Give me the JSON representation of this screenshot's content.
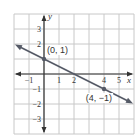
{
  "chart_data": {
    "type": "line",
    "title": "",
    "xlabel": "x",
    "ylabel": "y",
    "xlim": [
      -2,
      6
    ],
    "ylim": [
      -4,
      4
    ],
    "grid": true,
    "x_ticks": [
      {
        "value": -1,
        "label": "−1"
      },
      {
        "value": 1,
        "label": "1"
      },
      {
        "value": 2,
        "label": "2"
      },
      {
        "value": 4,
        "label": "4"
      },
      {
        "value": 5,
        "label": "5"
      }
    ],
    "y_ticks": [
      {
        "value": 3,
        "label": "3"
      },
      {
        "value": 2,
        "label": "2"
      },
      {
        "value": -1,
        "label": "−1"
      },
      {
        "value": -2,
        "label": "−2"
      },
      {
        "value": -3,
        "label": "−3"
      }
    ],
    "series": [
      {
        "name": "line",
        "equation": "y = -0.5x + 1",
        "x": [
          -2,
          6
        ],
        "y": [
          2,
          -2
        ]
      }
    ],
    "points": [
      {
        "x": 0,
        "y": 1,
        "label": "(0, 1)"
      },
      {
        "x": 4,
        "y": -1,
        "label": "(4, −1)"
      }
    ],
    "colors": {
      "grid": "#c8c8c8",
      "axis": "#333333",
      "line": "#555a66"
    }
  }
}
